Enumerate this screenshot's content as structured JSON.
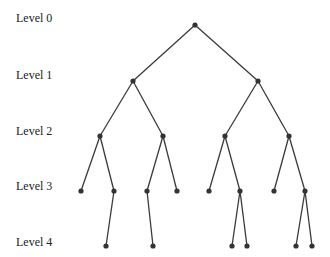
{
  "diagram": {
    "type": "tree",
    "levels": [
      {
        "label": "Level 0",
        "y": 25
      },
      {
        "label": "Level 1",
        "y": 81
      },
      {
        "label": "Level 2",
        "y": 136
      },
      {
        "label": "Level 3",
        "y": 191
      },
      {
        "label": "Level 4",
        "y": 246
      }
    ],
    "nodes": [
      {
        "id": "n0",
        "x": 195,
        "y": 25
      },
      {
        "id": "n1a",
        "x": 133,
        "y": 81
      },
      {
        "id": "n1b",
        "x": 258,
        "y": 81
      },
      {
        "id": "n2a",
        "x": 100,
        "y": 136
      },
      {
        "id": "n2b",
        "x": 163,
        "y": 136
      },
      {
        "id": "n2c",
        "x": 225,
        "y": 136
      },
      {
        "id": "n2d",
        "x": 289,
        "y": 136
      },
      {
        "id": "n3a",
        "x": 81,
        "y": 191
      },
      {
        "id": "n3b",
        "x": 114,
        "y": 191
      },
      {
        "id": "n3c",
        "x": 147,
        "y": 191
      },
      {
        "id": "n3d",
        "x": 177,
        "y": 191
      },
      {
        "id": "n3e",
        "x": 209,
        "y": 191
      },
      {
        "id": "n3f",
        "x": 240,
        "y": 191
      },
      {
        "id": "n3g",
        "x": 274,
        "y": 191
      },
      {
        "id": "n3h",
        "x": 305,
        "y": 191
      },
      {
        "id": "n4a",
        "x": 106,
        "y": 246
      },
      {
        "id": "n4b",
        "x": 153,
        "y": 246
      },
      {
        "id": "n4c",
        "x": 232,
        "y": 246
      },
      {
        "id": "n4d",
        "x": 247,
        "y": 246
      },
      {
        "id": "n4e",
        "x": 296,
        "y": 246
      },
      {
        "id": "n4f",
        "x": 312,
        "y": 246
      }
    ],
    "edges": [
      [
        "n0",
        "n1a"
      ],
      [
        "n0",
        "n1b"
      ],
      [
        "n1a",
        "n2a"
      ],
      [
        "n1a",
        "n2b"
      ],
      [
        "n1b",
        "n2c"
      ],
      [
        "n1b",
        "n2d"
      ],
      [
        "n2a",
        "n3a"
      ],
      [
        "n2a",
        "n3b"
      ],
      [
        "n2b",
        "n3c"
      ],
      [
        "n2b",
        "n3d"
      ],
      [
        "n2c",
        "n3e"
      ],
      [
        "n2c",
        "n3f"
      ],
      [
        "n2d",
        "n3g"
      ],
      [
        "n2d",
        "n3h"
      ],
      [
        "n3b",
        "n4a"
      ],
      [
        "n3c",
        "n4b"
      ],
      [
        "n3f",
        "n4c"
      ],
      [
        "n3f",
        "n4d"
      ],
      [
        "n3h",
        "n4e"
      ],
      [
        "n3h",
        "n4f"
      ]
    ],
    "colors": {
      "edge": "#3a3a3a",
      "node": "#333333"
    }
  }
}
